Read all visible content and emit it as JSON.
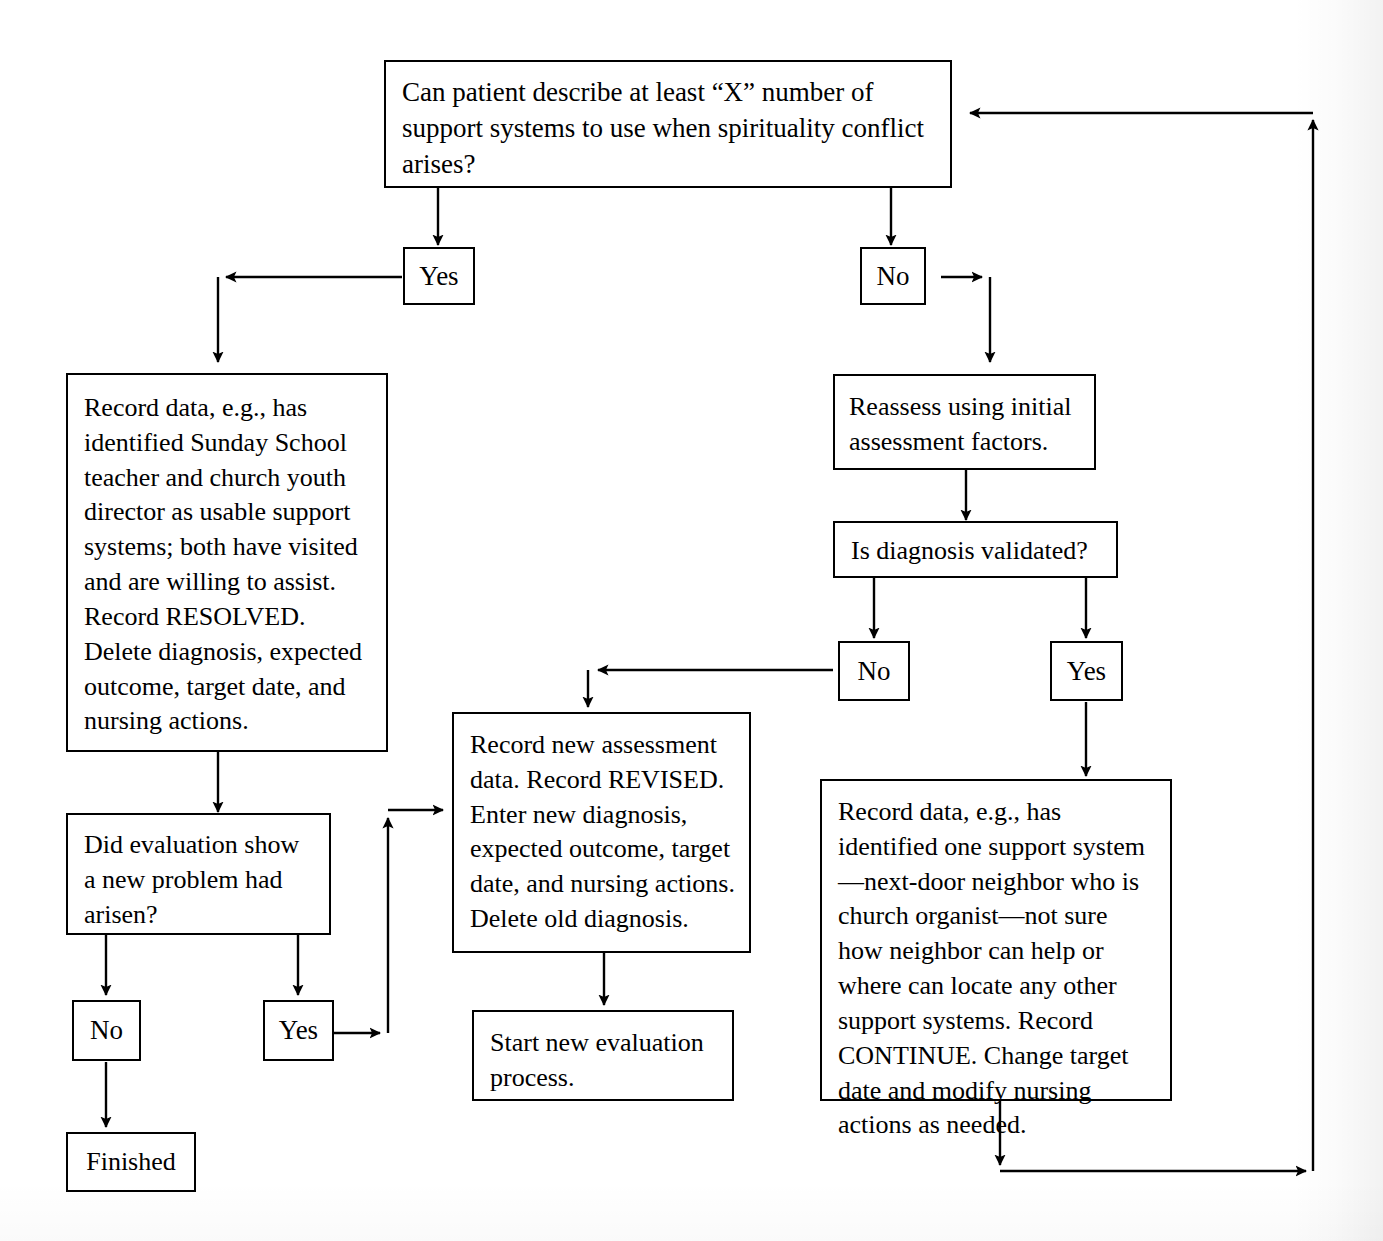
{
  "diagram": {
    "nodes": {
      "q_support_systems": "Can patient describe at least “X” number of support systems to use when spirituality conflict arises?",
      "yes_top": "Yes",
      "no_top": "No",
      "record_resolved": "Record data, e.g., has identified Sunday School teacher and church youth director as usable support systems; both have visited and are willing to assist. Record RESOLVED. Delete diagnosis, expected outcome, target date, and nursing actions.",
      "reassess": "Reassess using initial assessment factors.",
      "q_validated": "Is diagnosis validated?",
      "no_validated": "No",
      "yes_validated": "Yes",
      "record_revised": "Record new assessment data. Record REVISED. Enter new diagnosis, expected outcome, target date, and nursing actions. Delete old diagnosis.",
      "record_continue": "Record data, e.g., has identified one support system—next-door neighbor who is church organist—not sure how neighbor can help or where can locate any other support systems. Record CONTINUE. Change target date and modify nursing actions as needed.",
      "q_new_problem": "Did evaluation show a new problem had arisen?",
      "no_new_problem": "No",
      "yes_new_problem": "Yes",
      "finished": "Finished",
      "start_new_eval": "Start new evaluation process."
    },
    "edges": [
      {
        "from": "q_support_systems",
        "to": "yes_top",
        "label": ""
      },
      {
        "from": "q_support_systems",
        "to": "no_top",
        "label": ""
      },
      {
        "from": "yes_top",
        "to": "record_resolved",
        "label": ""
      },
      {
        "from": "no_top",
        "to": "reassess",
        "label": ""
      },
      {
        "from": "reassess",
        "to": "q_validated",
        "label": ""
      },
      {
        "from": "q_validated",
        "to": "no_validated",
        "label": ""
      },
      {
        "from": "q_validated",
        "to": "yes_validated",
        "label": ""
      },
      {
        "from": "no_validated",
        "to": "record_revised",
        "label": ""
      },
      {
        "from": "yes_validated",
        "to": "record_continue",
        "label": ""
      },
      {
        "from": "record_resolved",
        "to": "q_new_problem",
        "label": ""
      },
      {
        "from": "q_new_problem",
        "to": "no_new_problem",
        "label": ""
      },
      {
        "from": "q_new_problem",
        "to": "yes_new_problem",
        "label": ""
      },
      {
        "from": "no_new_problem",
        "to": "finished",
        "label": ""
      },
      {
        "from": "yes_new_problem",
        "to": "record_revised",
        "label": ""
      },
      {
        "from": "record_revised",
        "to": "start_new_eval",
        "label": ""
      },
      {
        "from": "record_continue",
        "to": "q_support_systems",
        "label": "feedback loop"
      }
    ],
    "colors": {
      "stroke": "#000000",
      "fill": "#ffffff",
      "text": "#000000"
    }
  }
}
